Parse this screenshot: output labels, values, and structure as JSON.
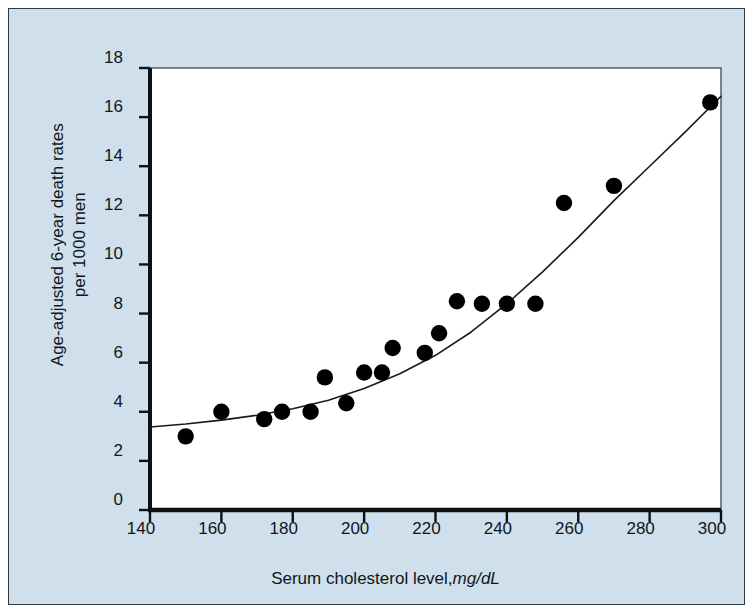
{
  "figure": {
    "background_color": "#cfe0ec",
    "plot_background_color": "#ffffff",
    "border_color": "#2b3a45",
    "marker_color": "#000000",
    "line_color": "#1a1a1a"
  },
  "chart_data": {
    "type": "scatter",
    "title": "",
    "subtitle": "",
    "xlabel_text": "Serum cholesterol level,",
    "xlabel_unit": "mg/dL",
    "xlabel": "Serum cholesterol level, mg/dL",
    "ylabel_line1": "Age-adjusted 6-year death rates",
    "ylabel_line2": "per 1000 men",
    "ylabel": "Age-adjusted 6-year death rates per 1000 men",
    "xlim": [
      140,
      300
    ],
    "ylim": [
      0,
      18
    ],
    "xticks": [
      140,
      160,
      180,
      200,
      220,
      240,
      260,
      280,
      300
    ],
    "yticks": [
      0,
      2,
      4,
      6,
      8,
      10,
      12,
      14,
      16,
      18
    ],
    "xtick_labels": [
      "140",
      "160",
      "180",
      "200",
      "220",
      "240",
      "260",
      "280",
      "300"
    ],
    "ytick_labels": [
      "0",
      "2",
      "4",
      "6",
      "8",
      "10",
      "12",
      "14",
      "16",
      "18"
    ],
    "grid": false,
    "legend": null,
    "legend_position": "none",
    "series": [
      {
        "name": "Observed death rate",
        "type": "scatter",
        "marker": "filled-circle",
        "color": "#000000",
        "points": [
          {
            "x": 150,
            "y": 3.0
          },
          {
            "x": 160,
            "y": 4.0
          },
          {
            "x": 172,
            "y": 3.7
          },
          {
            "x": 177,
            "y": 4.0
          },
          {
            "x": 185,
            "y": 4.0
          },
          {
            "x": 189,
            "y": 5.4
          },
          {
            "x": 195,
            "y": 4.35
          },
          {
            "x": 200,
            "y": 5.6
          },
          {
            "x": 205,
            "y": 5.6
          },
          {
            "x": 208,
            "y": 6.6
          },
          {
            "x": 217,
            "y": 6.4
          },
          {
            "x": 221,
            "y": 7.2
          },
          {
            "x": 226,
            "y": 8.5
          },
          {
            "x": 233,
            "y": 8.4
          },
          {
            "x": 240,
            "y": 8.4
          },
          {
            "x": 248,
            "y": 8.4
          },
          {
            "x": 256,
            "y": 12.5
          },
          {
            "x": 270,
            "y": 13.2
          },
          {
            "x": 297,
            "y": 16.6
          }
        ]
      },
      {
        "name": "Fitted curve",
        "type": "line",
        "color": "#1a1a1a",
        "points": [
          {
            "x": 140,
            "y": 3.38
          },
          {
            "x": 150,
            "y": 3.5
          },
          {
            "x": 160,
            "y": 3.66
          },
          {
            "x": 170,
            "y": 3.86
          },
          {
            "x": 180,
            "y": 4.12
          },
          {
            "x": 190,
            "y": 4.47
          },
          {
            "x": 200,
            "y": 4.95
          },
          {
            "x": 210,
            "y": 5.55
          },
          {
            "x": 220,
            "y": 6.3
          },
          {
            "x": 230,
            "y": 7.25
          },
          {
            "x": 240,
            "y": 8.4
          },
          {
            "x": 250,
            "y": 9.7
          },
          {
            "x": 260,
            "y": 11.1
          },
          {
            "x": 270,
            "y": 12.6
          },
          {
            "x": 280,
            "y": 14.0
          },
          {
            "x": 290,
            "y": 15.4
          },
          {
            "x": 300,
            "y": 16.85
          }
        ]
      }
    ]
  }
}
